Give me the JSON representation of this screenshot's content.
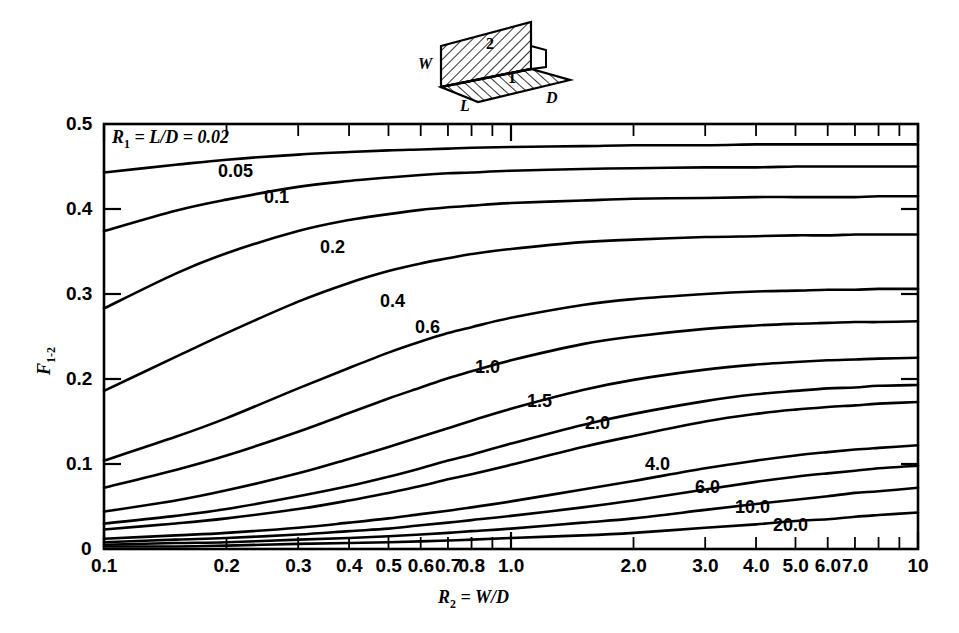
{
  "figure": {
    "kind": "view-factor-chart",
    "background": "#ffffff",
    "line_color": "#000000"
  },
  "diagram": {
    "name": "perpendicular-rectangles-with-common-edge",
    "labels": {
      "W": "W",
      "L": "L",
      "D": "D",
      "surface_1": "1",
      "surface_2": "2"
    }
  },
  "annotation": {
    "family_note_prefix": "R",
    "family_note_sub": "1",
    "family_note_body": " = L/D = 0.02"
  },
  "axes": {
    "x_title_prefix": "R",
    "x_title_sub": "2",
    "x_title_body": " = W/D",
    "y_title_prefix": "F",
    "y_title_sub": "1-2",
    "x_scale": "log",
    "y_scale": "linear",
    "xlim": [
      0.1,
      10
    ],
    "ylim": [
      0,
      0.5
    ],
    "x_tick_labels": [
      "0.1",
      "0.2",
      "0.3",
      "0.4",
      "0.5",
      "0.6",
      "0.7",
      "0.8",
      "1.0",
      "2.0",
      "3.0",
      "4.0",
      "5.0",
      "6.0",
      "7.0",
      "10"
    ],
    "x_tick_values": [
      0.1,
      0.2,
      0.3,
      0.4,
      0.5,
      0.6,
      0.7,
      0.8,
      1.0,
      2.0,
      3.0,
      4.0,
      5.0,
      6.0,
      7.0,
      10
    ],
    "y_tick_labels": [
      "0",
      "0.1",
      "0.2",
      "0.3",
      "0.4",
      "0.5"
    ],
    "y_tick_values": [
      0,
      0.1,
      0.2,
      0.3,
      0.4,
      0.5
    ]
  },
  "chart_data": {
    "type": "line",
    "title": "",
    "subtitle": "",
    "xlabel": "R2 = W/D",
    "ylabel": "F1-2",
    "xscale": "log",
    "xlim": [
      0.1,
      10
    ],
    "ylim": [
      0,
      0.5
    ],
    "grid": false,
    "legend": "inline-curve-labels",
    "x": [
      0.1,
      0.15,
      0.2,
      0.3,
      0.4,
      0.5,
      0.6,
      0.7,
      0.8,
      1.0,
      1.5,
      2.0,
      3.0,
      4.0,
      5.0,
      6.0,
      7.0,
      8.0,
      10.0
    ],
    "series": [
      {
        "name": "0.02",
        "label": "R1 = L/D = 0.02",
        "values": [
          0.443,
          0.452,
          0.458,
          0.464,
          0.467,
          0.469,
          0.47,
          0.471,
          0.472,
          0.473,
          0.474,
          0.475,
          0.475,
          0.476,
          0.476,
          0.476,
          0.476,
          0.476,
          0.476
        ]
      },
      {
        "name": "0.05",
        "values": [
          0.374,
          0.398,
          0.411,
          0.426,
          0.433,
          0.437,
          0.44,
          0.442,
          0.443,
          0.445,
          0.447,
          0.448,
          0.449,
          0.449,
          0.45,
          0.45,
          0.45,
          0.45,
          0.45
        ]
      },
      {
        "name": "0.1",
        "values": [
          0.283,
          0.324,
          0.348,
          0.374,
          0.387,
          0.394,
          0.399,
          0.402,
          0.404,
          0.407,
          0.41,
          0.412,
          0.413,
          0.414,
          0.414,
          0.414,
          0.414,
          0.415,
          0.415
        ]
      },
      {
        "name": "0.2",
        "values": [
          0.186,
          0.226,
          0.254,
          0.291,
          0.313,
          0.327,
          0.336,
          0.342,
          0.347,
          0.353,
          0.361,
          0.364,
          0.367,
          0.368,
          0.369,
          0.369,
          0.37,
          0.37,
          0.37
        ]
      },
      {
        "name": "0.4",
        "values": [
          0.104,
          0.132,
          0.154,
          0.189,
          0.213,
          0.231,
          0.244,
          0.254,
          0.261,
          0.272,
          0.287,
          0.294,
          0.3,
          0.303,
          0.304,
          0.305,
          0.305,
          0.306,
          0.306
        ]
      },
      {
        "name": "0.6",
        "values": [
          0.072,
          0.093,
          0.11,
          0.138,
          0.16,
          0.177,
          0.19,
          0.201,
          0.209,
          0.222,
          0.241,
          0.25,
          0.259,
          0.263,
          0.265,
          0.266,
          0.267,
          0.267,
          0.268
        ]
      },
      {
        "name": "1.0",
        "values": [
          0.044,
          0.057,
          0.069,
          0.089,
          0.106,
          0.12,
          0.132,
          0.142,
          0.151,
          0.165,
          0.187,
          0.199,
          0.211,
          0.217,
          0.22,
          0.222,
          0.223,
          0.224,
          0.225
        ]
      },
      {
        "name": "1.5",
        "values": [
          0.03,
          0.039,
          0.047,
          0.062,
          0.074,
          0.085,
          0.095,
          0.104,
          0.111,
          0.124,
          0.146,
          0.159,
          0.174,
          0.182,
          0.186,
          0.189,
          0.19,
          0.192,
          0.193
        ]
      },
      {
        "name": "2.0",
        "values": [
          0.023,
          0.03,
          0.036,
          0.047,
          0.057,
          0.066,
          0.074,
          0.082,
          0.088,
          0.099,
          0.12,
          0.133,
          0.15,
          0.159,
          0.164,
          0.167,
          0.169,
          0.171,
          0.173
        ]
      },
      {
        "name": "4.0",
        "values": [
          0.012,
          0.016,
          0.019,
          0.025,
          0.031,
          0.036,
          0.041,
          0.045,
          0.049,
          0.056,
          0.07,
          0.08,
          0.095,
          0.104,
          0.11,
          0.114,
          0.117,
          0.119,
          0.122
        ]
      },
      {
        "name": "6.0",
        "values": [
          0.008,
          0.011,
          0.013,
          0.017,
          0.021,
          0.024,
          0.028,
          0.031,
          0.034,
          0.039,
          0.049,
          0.057,
          0.07,
          0.079,
          0.085,
          0.089,
          0.092,
          0.095,
          0.098
        ]
      },
      {
        "name": "10.0",
        "values": [
          0.005,
          0.007,
          0.008,
          0.011,
          0.013,
          0.015,
          0.017,
          0.019,
          0.021,
          0.024,
          0.031,
          0.036,
          0.046,
          0.053,
          0.058,
          0.062,
          0.066,
          0.068,
          0.072
        ]
      },
      {
        "name": "20.0",
        "values": [
          0.003,
          0.003,
          0.004,
          0.006,
          0.007,
          0.008,
          0.009,
          0.01,
          0.011,
          0.013,
          0.016,
          0.019,
          0.025,
          0.029,
          0.033,
          0.035,
          0.038,
          0.04,
          0.043
        ]
      }
    ],
    "curve_labels": [
      {
        "text": "0.05",
        "x": 218,
        "y": 162
      },
      {
        "text": "0.1",
        "x": 264,
        "y": 188
      },
      {
        "text": "0.2",
        "x": 320,
        "y": 238
      },
      {
        "text": "0.4",
        "x": 380,
        "y": 292
      },
      {
        "text": "0.6",
        "x": 415,
        "y": 318
      },
      {
        "text": "1.0",
        "x": 475,
        "y": 358
      },
      {
        "text": "1.5",
        "x": 527,
        "y": 392
      },
      {
        "text": "2.0",
        "x": 585,
        "y": 414
      },
      {
        "text": "4.0",
        "x": 645,
        "y": 455
      },
      {
        "text": "6.0",
        "x": 695,
        "y": 478
      },
      {
        "text": "10.0",
        "x": 735,
        "y": 498
      },
      {
        "text": "20.0",
        "x": 773,
        "y": 516
      }
    ]
  }
}
